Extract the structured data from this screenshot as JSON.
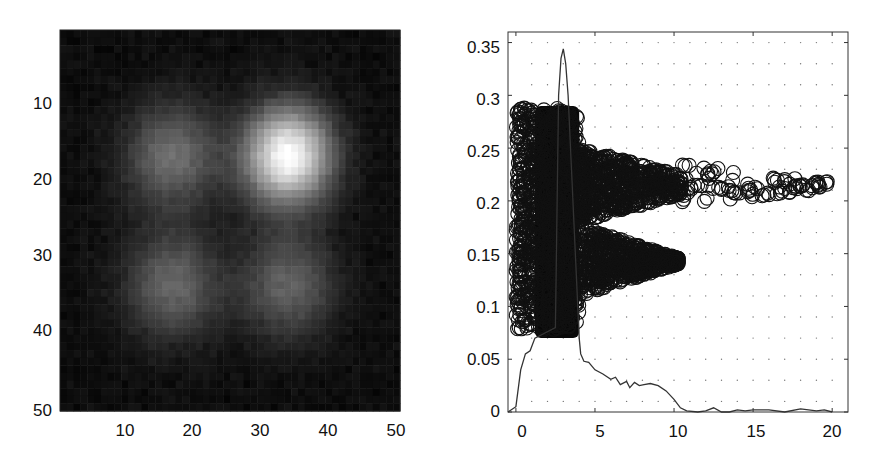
{
  "chart_data": [
    {
      "type": "heatmap",
      "title": "",
      "xlabel": "",
      "ylabel": "",
      "colormap": "gray",
      "xlim": [
        0.5,
        50.5
      ],
      "ylim": [
        0.5,
        50.5
      ],
      "y_reversed": true,
      "xticks": [
        10,
        20,
        30,
        40,
        50
      ],
      "yticks": [
        10,
        20,
        30,
        40,
        50
      ],
      "background_intensity": 0.03,
      "blobs": [
        {
          "name": "top-left",
          "cx": 17,
          "cy": 17,
          "radius": 6.5,
          "peak": 0.38
        },
        {
          "name": "top-right",
          "cx": 34,
          "cy": 17,
          "radius": 6.0,
          "peak": 0.95
        },
        {
          "name": "bottom-left",
          "cx": 17,
          "cy": 34,
          "radius": 6.5,
          "peak": 0.35
        },
        {
          "name": "bottom-right",
          "cx": 34,
          "cy": 34,
          "radius": 6.5,
          "peak": 0.33
        }
      ],
      "grid": false
    },
    {
      "type": "scatter",
      "title": "",
      "xlabel": "",
      "ylabel": "",
      "xlim": [
        -0.5,
        21
      ],
      "ylim": [
        0,
        0.36
      ],
      "xticks": [
        0,
        5,
        10,
        15,
        20
      ],
      "yticks": [
        0,
        0.05,
        0.1,
        0.15,
        0.2,
        0.25,
        0.3,
        0.35
      ],
      "ytick_labels": [
        "0",
        "0.05",
        "0.1",
        "0.15",
        "0.2",
        "0.25",
        "0.3",
        "0.35"
      ],
      "grid": "dotted",
      "series": [
        {
          "name": "circles",
          "marker": "open-circle",
          "regions": [
            {
              "name": "dense-core",
              "x_range": [
                0,
                4
              ],
              "y_range": [
                0.07,
                0.29
              ]
            },
            {
              "name": "upper-branch",
              "x_range": [
                4,
                20
              ],
              "y_center": 0.215,
              "y_spread_start": 0.035,
              "y_spread_end": 0.005
            },
            {
              "name": "lower-branch",
              "x_range": [
                4,
                10.5
              ],
              "y_center": 0.143,
              "y_spread_start": 0.035,
              "y_spread_end": 0.002
            }
          ]
        },
        {
          "name": "density-curve",
          "type": "line",
          "x": [
            -0.5,
            0,
            0.3,
            0.6,
            0.9,
            1.2,
            2.5,
            2.7,
            2.85,
            3.0,
            3.15,
            3.3,
            4.0,
            4.1,
            4.3,
            4.6,
            5.0,
            5.5,
            6.0,
            6.3,
            6.6,
            7.0,
            7.2,
            7.5,
            7.8,
            8.1,
            8.5,
            9.0,
            9.5,
            10.0,
            10.4,
            10.8,
            11.5,
            12.0,
            12.5,
            13.0,
            13.5,
            14.0,
            14.5,
            15.0,
            16.0,
            17.0,
            18.0,
            19.0,
            19.5,
            20.0
          ],
          "y": [
            0,
            0.005,
            0.04,
            0.055,
            0.058,
            0.07,
            0.08,
            0.3,
            0.335,
            0.344,
            0.33,
            0.3,
            0.07,
            0.055,
            0.048,
            0.047,
            0.04,
            0.036,
            0.031,
            0.033,
            0.026,
            0.029,
            0.023,
            0.028,
            0.025,
            0.026,
            0.027,
            0.025,
            0.02,
            0.012,
            0.004,
            0.001,
            0.0,
            0.001,
            0.004,
            0.0,
            0.0,
            0.002,
            0.001,
            0.002,
            0.002,
            0.0,
            0.003,
            0.001,
            0.002,
            0.0
          ]
        }
      ]
    }
  ],
  "left_plot": {
    "yticks": [
      "10",
      "20",
      "30",
      "40",
      "50"
    ],
    "xticks": [
      "10",
      "20",
      "30",
      "40",
      "50"
    ]
  },
  "right_plot": {
    "yticks": [
      "0",
      "0.05",
      "0.1",
      "0.15",
      "0.2",
      "0.25",
      "0.3",
      "0.35"
    ],
    "xticks": [
      "0",
      "5",
      "10",
      "15",
      "20"
    ]
  }
}
